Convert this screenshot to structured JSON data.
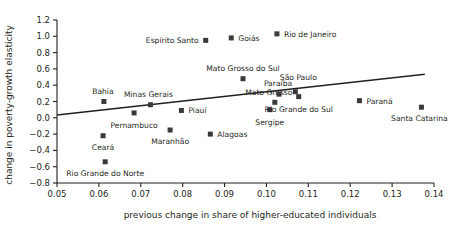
{
  "chart_data": {
    "type": "scatter",
    "title": "",
    "xlabel": "previous change in share of higher-educated individuals",
    "ylabel": "change in poverty-growth elasticity",
    "xlim": [
      0.05,
      0.14
    ],
    "ylim": [
      -0.8,
      1.2
    ],
    "xticks": [
      "0.05",
      "0.06",
      "0.07",
      "0.08",
      "0.09",
      "0.10",
      "0.11",
      "0.12",
      "0.13",
      "0.14"
    ],
    "xtick_values": [
      0.05,
      0.06,
      0.07,
      0.08,
      0.09,
      0.1,
      0.11,
      0.12,
      0.13,
      0.14
    ],
    "yticks": [
      "1.2",
      "1.0",
      "0.8",
      "0.6",
      "0.4",
      "0.2",
      "0.0",
      "-0.2",
      "-0.4",
      "-0.6",
      "-0.8"
    ],
    "ytick_values": [
      1.2,
      1.0,
      0.8,
      0.6,
      0.4,
      0.2,
      0.0,
      -0.2,
      -0.4,
      -0.6,
      -0.8
    ],
    "grid": false,
    "legend": false,
    "marker_color": "#3a3a3c",
    "line_color": "#231f20",
    "points": [
      {
        "label": "Bahia",
        "x": 0.0612,
        "y": 0.2,
        "label_dx": -1,
        "label_dy": -8,
        "anchor": "middle"
      },
      {
        "label": "Ceará",
        "x": 0.061,
        "y": -0.22,
        "label_dx": 0,
        "label_dy": 14,
        "anchor": "middle"
      },
      {
        "label": "Rio Grande do Norte",
        "x": 0.0615,
        "y": -0.54,
        "label_dx": 0,
        "label_dy": 14,
        "anchor": "middle"
      },
      {
        "label": "Pernambuco",
        "x": 0.0684,
        "y": 0.06,
        "label_dx": 0,
        "label_dy": 15,
        "anchor": "middle"
      },
      {
        "label": "Minas Gerais",
        "x": 0.0723,
        "y": 0.16,
        "label_dx": -2,
        "label_dy": -8,
        "anchor": "middle"
      },
      {
        "label": "Maranhão",
        "x": 0.077,
        "y": -0.15,
        "label_dx": 0,
        "label_dy": 14,
        "anchor": "middle"
      },
      {
        "label": "Piauí",
        "x": 0.0797,
        "y": 0.09,
        "label_dx": 7,
        "label_dy": 3,
        "anchor": "start"
      },
      {
        "label": "Espírito Santo",
        "x": 0.0855,
        "y": 0.95,
        "label_dx": -7,
        "label_dy": 3,
        "anchor": "end"
      },
      {
        "label": "Alagoas",
        "x": 0.0866,
        "y": -0.2,
        "label_dx": 7,
        "label_dy": 3,
        "anchor": "start"
      },
      {
        "label": "Goiás",
        "x": 0.0916,
        "y": 0.98,
        "label_dx": 7,
        "label_dy": 3,
        "anchor": "start"
      },
      {
        "label": "Mato Grosso do Sul",
        "x": 0.0944,
        "y": 0.48,
        "label_dx": 0,
        "label_dy": -8,
        "anchor": "middle"
      },
      {
        "label": "Sergipe",
        "x": 0.1008,
        "y": 0.1,
        "label_dx": 0,
        "label_dy": 15,
        "anchor": "middle"
      },
      {
        "label": "Mato Grosso",
        "x": 0.102,
        "y": 0.19,
        "label_dx": -6,
        "label_dy": -7,
        "anchor": "middle"
      },
      {
        "label": "Rio de Janeiro",
        "x": 0.1025,
        "y": 1.03,
        "label_dx": 7,
        "label_dy": 3,
        "anchor": "start"
      },
      {
        "label": "Paraíba",
        "x": 0.103,
        "y": 0.29,
        "label_dx": -1,
        "label_dy": -8,
        "anchor": "middle"
      },
      {
        "label": "São Paulo",
        "x": 0.1069,
        "y": 0.32,
        "label_dx": 3,
        "label_dy": -12,
        "anchor": "middle"
      },
      {
        "label": "Rio Grande do Sul",
        "x": 0.1077,
        "y": 0.26,
        "label_dx": 0,
        "label_dy": 15,
        "anchor": "middle"
      },
      {
        "label": "Paraná",
        "x": 0.1222,
        "y": 0.21,
        "label_dx": 7,
        "label_dy": 3,
        "anchor": "start"
      },
      {
        "label": "Santa Catarina",
        "x": 0.137,
        "y": 0.13,
        "label_dx": -2,
        "label_dy": 14,
        "anchor": "middle"
      }
    ],
    "trendline": {
      "x1": 0.05,
      "y1": 0.035,
      "x2": 0.1378,
      "y2": 0.535
    }
  }
}
